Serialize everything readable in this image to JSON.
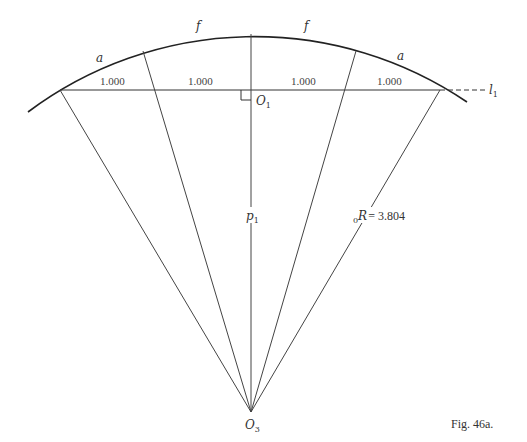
{
  "figure": {
    "caption": "Fig. 46a.",
    "arc_labels": {
      "left_outer": "a",
      "left_inner": "f",
      "right_inner": "f",
      "right_outer": "a"
    },
    "chord_segments": [
      "1.000",
      "1.000",
      "1.000",
      "1.000"
    ],
    "line_label": "l",
    "line_label_sub": "1",
    "point_top": {
      "name": "O",
      "sub": "1"
    },
    "point_center": {
      "name": "O",
      "sub": "3"
    },
    "p_label": {
      "name": "p",
      "sub": "1"
    },
    "radius_label": {
      "pre_sub": "0",
      "name": "R",
      "value": "= 3.804"
    }
  },
  "colors": {
    "line": "#333333",
    "background": "#ffffff"
  }
}
